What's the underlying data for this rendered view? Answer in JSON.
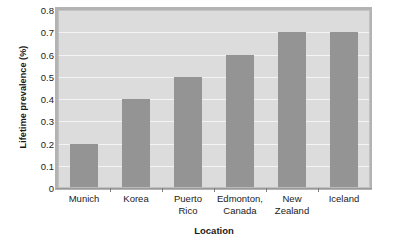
{
  "chart_data": {
    "type": "bar",
    "title": "",
    "subtitle": "",
    "xlabel": "Location",
    "ylabel": "Lifetime prevalence (%)",
    "categories": [
      "Munich",
      "Korea",
      "Puerto Rico",
      "Edmonton, Canada",
      "New Zealand",
      "Iceland"
    ],
    "category_lines": [
      [
        "Munich"
      ],
      [
        "Korea"
      ],
      [
        "Puerto",
        "Rico"
      ],
      [
        "Edmonton,",
        "Canada"
      ],
      [
        "New",
        "Zealand"
      ],
      [
        "Iceland"
      ]
    ],
    "values": [
      0.2,
      0.4,
      0.5,
      0.6,
      0.7,
      0.7
    ],
    "ylim": [
      0,
      0.8
    ],
    "ytick_values": [
      0,
      0.1,
      0.2,
      0.3,
      0.4,
      0.5,
      0.6,
      0.7,
      0.8
    ],
    "ytick_labels": [
      "0",
      "0.1",
      "0.2",
      "0.3",
      "0.4",
      "0.5",
      "0.6",
      "0.7",
      "0.8"
    ],
    "grid": true,
    "grid_axis": "y",
    "legend": false,
    "legend_position": "none",
    "annotations": []
  },
  "colors": {
    "bar": "#949494",
    "plot_background": "#dcdcdc",
    "gridline": "#f4f4f4",
    "page_background": "#ffffff",
    "text": "#1a1a1a",
    "frame_shadow": "#b3b3b3",
    "axis_line": "#9a9a9a"
  }
}
